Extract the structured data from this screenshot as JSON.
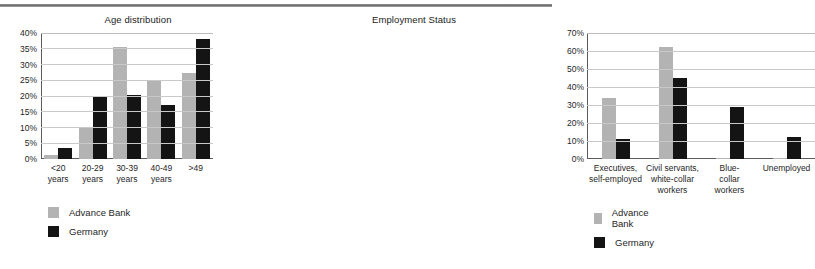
{
  "figure": {
    "background": "#ffffff",
    "series_colors": {
      "advance_bank": "#b3b3b3",
      "germany": "#141414"
    }
  },
  "legend": {
    "entries": [
      {
        "label": "Advance Bank",
        "color": "#b3b3b3"
      },
      {
        "label": "Germany",
        "color": "#141414"
      }
    ]
  },
  "chart_data": [
    {
      "type": "bar",
      "title": "Age distribution",
      "xlabel": "",
      "ylabel": "",
      "ylim": [
        0,
        40
      ],
      "yticks": [
        "0%",
        "5%",
        "10%",
        "15%",
        "20%",
        "25%",
        "30%",
        "35%",
        "40%"
      ],
      "ytick_values": [
        0,
        5,
        10,
        15,
        20,
        25,
        30,
        35,
        40
      ],
      "grid": true,
      "legend_position": "below-left",
      "categories": [
        "<20 years",
        "20-29 years",
        "30-39 years",
        "40-49 years",
        ">49"
      ],
      "category_lines": [
        [
          "<20",
          "years"
        ],
        [
          "20-29",
          "years"
        ],
        [
          "30-39",
          "years"
        ],
        [
          "40-49",
          "years"
        ],
        [
          ">49",
          ""
        ]
      ],
      "series": [
        {
          "name": "Advance Bank",
          "color": "#b3b3b3",
          "values": [
            1.2,
            10.0,
            35.5,
            25.0,
            27.2
          ]
        },
        {
          "name": "Germany",
          "color": "#141414",
          "values": [
            3.6,
            20.0,
            20.2,
            17.0,
            38.0
          ]
        }
      ]
    },
    {
      "type": "bar",
      "title": "Employment Status",
      "xlabel": "",
      "ylabel": "",
      "ylim": [
        0,
        70
      ],
      "yticks": [
        "0%",
        "10%",
        "20%",
        "30%",
        "40%",
        "50%",
        "60%",
        "70%"
      ],
      "ytick_values": [
        0,
        10,
        20,
        30,
        40,
        50,
        60,
        70
      ],
      "grid": true,
      "legend_position": "below-left",
      "categories": [
        "Executives, self-employed",
        "Civil servants, white-collar workers",
        "Blue-collar workers",
        "Unemployed"
      ],
      "category_lines": [
        [
          "Executives,",
          "self-employed",
          ""
        ],
        [
          "Civil servants,",
          "white-collar",
          "workers"
        ],
        [
          "Blue-",
          "collar",
          "workers"
        ],
        [
          "Unemployed",
          "",
          ""
        ]
      ],
      "series": [
        {
          "name": "Advance Bank",
          "color": "#b3b3b3",
          "values": [
            34.0,
            62.0,
            0.6,
            0.6
          ]
        },
        {
          "name": "Germany",
          "color": "#141414",
          "values": [
            11.0,
            45.0,
            29.0,
            12.0
          ]
        }
      ]
    }
  ]
}
